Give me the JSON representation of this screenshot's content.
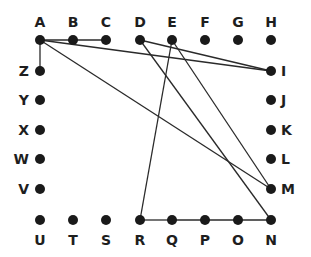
{
  "diagram": {
    "title": "",
    "colors": {
      "dot": "#1a1a1a",
      "line": "#2a2a2a",
      "label": "#1e1e1e",
      "background": "#ffffff"
    },
    "nodes": [
      {
        "id": "A",
        "x": 40,
        "y": 40,
        "lx": 40,
        "ly": 27,
        "anchor": "middle"
      },
      {
        "id": "B",
        "x": 73,
        "y": 40,
        "lx": 73,
        "ly": 27,
        "anchor": "middle"
      },
      {
        "id": "C",
        "x": 106,
        "y": 40,
        "lx": 106,
        "ly": 27,
        "anchor": "middle"
      },
      {
        "id": "D",
        "x": 140,
        "y": 40,
        "lx": 140,
        "ly": 27,
        "anchor": "middle"
      },
      {
        "id": "E",
        "x": 172,
        "y": 40,
        "lx": 172,
        "ly": 27,
        "anchor": "middle"
      },
      {
        "id": "F",
        "x": 205,
        "y": 40,
        "lx": 205,
        "ly": 27,
        "anchor": "middle"
      },
      {
        "id": "G",
        "x": 238,
        "y": 40,
        "lx": 238,
        "ly": 27,
        "anchor": "middle"
      },
      {
        "id": "H",
        "x": 271,
        "y": 40,
        "lx": 271,
        "ly": 27,
        "anchor": "middle"
      },
      {
        "id": "I",
        "x": 271,
        "y": 71,
        "lx": 281,
        "ly": 76,
        "anchor": "start"
      },
      {
        "id": "J",
        "x": 271,
        "y": 100,
        "lx": 281,
        "ly": 105,
        "anchor": "start"
      },
      {
        "id": "K",
        "x": 271,
        "y": 130,
        "lx": 281,
        "ly": 135,
        "anchor": "start"
      },
      {
        "id": "L",
        "x": 271,
        "y": 159,
        "lx": 281,
        "ly": 164,
        "anchor": "start"
      },
      {
        "id": "M",
        "x": 271,
        "y": 189,
        "lx": 281,
        "ly": 194,
        "anchor": "start"
      },
      {
        "id": "N",
        "x": 271,
        "y": 220,
        "lx": 271,
        "ly": 245,
        "anchor": "middle"
      },
      {
        "id": "O",
        "x": 238,
        "y": 220,
        "lx": 238,
        "ly": 245,
        "anchor": "middle"
      },
      {
        "id": "P",
        "x": 205,
        "y": 220,
        "lx": 205,
        "ly": 245,
        "anchor": "middle"
      },
      {
        "id": "Q",
        "x": 172,
        "y": 220,
        "lx": 172,
        "ly": 245,
        "anchor": "middle"
      },
      {
        "id": "R",
        "x": 140,
        "y": 220,
        "lx": 140,
        "ly": 245,
        "anchor": "middle"
      },
      {
        "id": "S",
        "x": 106,
        "y": 220,
        "lx": 106,
        "ly": 245,
        "anchor": "middle"
      },
      {
        "id": "T",
        "x": 73,
        "y": 220,
        "lx": 73,
        "ly": 245,
        "anchor": "middle"
      },
      {
        "id": "U",
        "x": 40,
        "y": 220,
        "lx": 40,
        "ly": 245,
        "anchor": "middle"
      },
      {
        "id": "V",
        "x": 40,
        "y": 189,
        "lx": 29,
        "ly": 194,
        "anchor": "end"
      },
      {
        "id": "W",
        "x": 40,
        "y": 159,
        "lx": 29,
        "ly": 164,
        "anchor": "end"
      },
      {
        "id": "X",
        "x": 40,
        "y": 130,
        "lx": 29,
        "ly": 135,
        "anchor": "end"
      },
      {
        "id": "Y",
        "x": 40,
        "y": 100,
        "lx": 29,
        "ly": 105,
        "anchor": "end"
      },
      {
        "id": "Z",
        "x": 40,
        "y": 71,
        "lx": 29,
        "ly": 76,
        "anchor": "end"
      }
    ],
    "edges": [
      [
        "A",
        "B"
      ],
      [
        "B",
        "C"
      ],
      [
        "A",
        "Z"
      ],
      [
        "A",
        "I"
      ],
      [
        "A",
        "M"
      ],
      [
        "D",
        "I"
      ],
      [
        "D",
        "N"
      ],
      [
        "E",
        "R"
      ],
      [
        "E",
        "M"
      ],
      [
        "R",
        "Q"
      ],
      [
        "Q",
        "P"
      ],
      [
        "P",
        "O"
      ],
      [
        "O",
        "N"
      ]
    ]
  }
}
